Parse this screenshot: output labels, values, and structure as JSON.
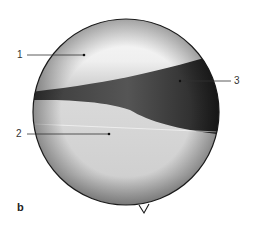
{
  "figure": {
    "panel_letter": "b",
    "labels": [
      {
        "id": "1",
        "text": "1"
      },
      {
        "id": "2",
        "text": "2"
      },
      {
        "id": "3",
        "text": "3"
      }
    ]
  }
}
